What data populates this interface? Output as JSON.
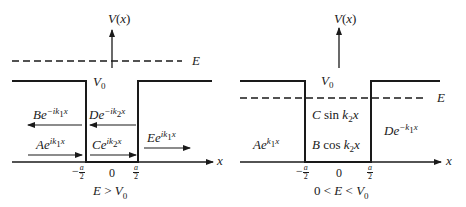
{
  "diagrams": [
    {
      "id": "left",
      "y_axis_label": "V(x)",
      "energy_label": "E",
      "barrier_label": "V0",
      "x_axis_label": "x",
      "ticks": [
        "-a/2",
        "0",
        "a/2"
      ],
      "caption": "E > V0",
      "case": "E > V0",
      "waves": [
        {
          "coef": "B",
          "exp": "-ik1x",
          "direction": "left",
          "region": "left"
        },
        {
          "coef": "A",
          "exp": "ik1x",
          "direction": "right",
          "region": "left"
        },
        {
          "coef": "D",
          "exp": "-ik2x",
          "direction": "left",
          "region": "middle"
        },
        {
          "coef": "C",
          "exp": "ik2x",
          "direction": "right",
          "region": "middle"
        },
        {
          "coef": "E",
          "exp": "ik1x",
          "direction": "right",
          "region": "right"
        }
      ]
    },
    {
      "id": "right",
      "y_axis_label": "V(x)",
      "energy_label": "E",
      "barrier_label": "V0",
      "x_axis_label": "x",
      "ticks": [
        "-a/2",
        "0",
        "a/2"
      ],
      "caption": "0 < E < V0",
      "case": "0 < E < V0",
      "solutions": [
        {
          "text": "Ae^{k1x}",
          "region": "left"
        },
        {
          "text": "C sin k2x",
          "region": "middle"
        },
        {
          "text": "B cos k2x",
          "region": "middle"
        },
        {
          "text": "De^{-k1x}",
          "region": "right"
        }
      ]
    }
  ],
  "labels": {
    "V": "V",
    "x": "x",
    "E": "E",
    "V0_main": "V",
    "V0_sub": "0",
    "zero": "0",
    "minus": "−",
    "a": "a",
    "two": "2",
    "left": {
      "B": "B",
      "B_exp_pre": "e",
      "B_exp": "−ik",
      "B_exp_sub": "1",
      "B_exp_post": "x",
      "D": "D",
      "D_exp_pre": "e",
      "D_exp": "−ik",
      "D_exp_sub": "2",
      "D_exp_post": "x",
      "A": "A",
      "A_exp_pre": "e",
      "A_exp": "ik",
      "A_exp_sub": "1",
      "A_exp_post": "x",
      "C": "C",
      "C_exp_pre": "e",
      "C_exp": "ik",
      "C_exp_sub": "2",
      "C_exp_post": "x",
      "E": "E",
      "E_exp_pre": "e",
      "E_exp": "ik",
      "E_exp_sub": "1",
      "E_exp_post": "x",
      "cap_E": "E",
      "cap_op": " > ",
      "cap_V": "V",
      "cap_sub": "0"
    },
    "right": {
      "C": "C",
      "sin": " sin ",
      "k": "k",
      "k_sub": "2",
      "xv": "x",
      "B": "B",
      "cos": " cos ",
      "A": "A",
      "A_e": "e",
      "A_exp": "k",
      "A_exp_sub": "1",
      "A_exp_post": "x",
      "D": "D",
      "D_e": "e",
      "D_exp": "−k",
      "D_exp_sub": "1",
      "D_exp_post": "x",
      "cap_zero": "0",
      "cap_lt": " < ",
      "cap_E": "E",
      "cap_V": "V",
      "cap_sub": "0"
    }
  }
}
